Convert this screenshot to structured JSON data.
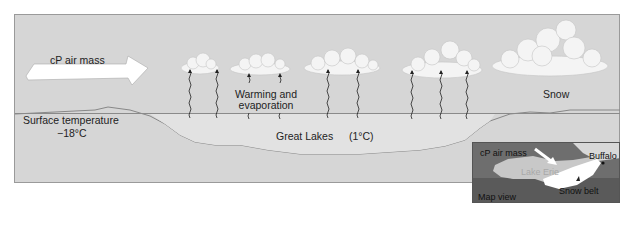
{
  "diagram": {
    "labels": {
      "air_mass": "cP air mass",
      "warming": "Warming and",
      "evaporation": "evaporation",
      "surface_temp_label": "Surface  temperature",
      "surface_temp_value": "−18°C",
      "lakes": "Great Lakes",
      "lake_temp": "(1°C)",
      "snow": "Snow"
    },
    "inset_map": {
      "air_mass": "cP air mass",
      "lake": "Lake Erie",
      "city": "Buffalo",
      "snow_belt": "Snow belt",
      "caption": "Map view"
    },
    "colors": {
      "background": "#d6d6d6",
      "lake": "#e2e2e2",
      "cloud": "#f4f4f4",
      "arrow": "#ffffff",
      "map_land": "#6e6e6e",
      "map_lake": "#c8c8c8",
      "snow_belt": "#ffffff"
    },
    "icons": [
      "arrow-right-icon",
      "cloud-icon",
      "wavy-arrow-up-icon"
    ]
  }
}
